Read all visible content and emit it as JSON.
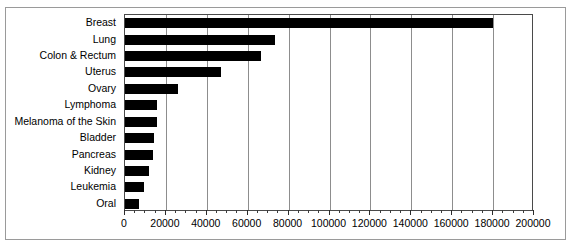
{
  "chart_data": {
    "type": "bar",
    "orientation": "horizontal",
    "title": "",
    "xlabel": "",
    "ylabel": "",
    "categories": [
      "Breast",
      "Lung",
      "Colon & Rectum",
      "Uterus",
      "Ovary",
      "Lymphoma",
      "Melanoma of the Skin",
      "Bladder",
      "Pancreas",
      "Kidney",
      "Leukemia",
      "Oral"
    ],
    "values": [
      180000,
      73300,
      66500,
      47000,
      26000,
      15700,
      15700,
      14300,
      13800,
      11800,
      9500,
      6900
    ],
    "xlim": [
      0,
      200000
    ],
    "xticks": [
      0,
      20000,
      40000,
      60000,
      80000,
      100000,
      120000,
      140000,
      160000,
      180000,
      200000
    ],
    "xticklabels": [
      "0",
      "20000",
      "40000",
      "60000",
      "80000",
      "100000",
      "120000",
      "140000",
      "160000",
      "180000",
      "200000"
    ],
    "minor_ticks_per_interval": 4,
    "grid": "vertical-major",
    "legend": null,
    "colors": {
      "bar": "#000000",
      "gridline": "#8d8d8d",
      "axis": "#4a4a4a",
      "frame": "#9a9a9a",
      "background": "#ffffff",
      "text": "#000000"
    }
  }
}
